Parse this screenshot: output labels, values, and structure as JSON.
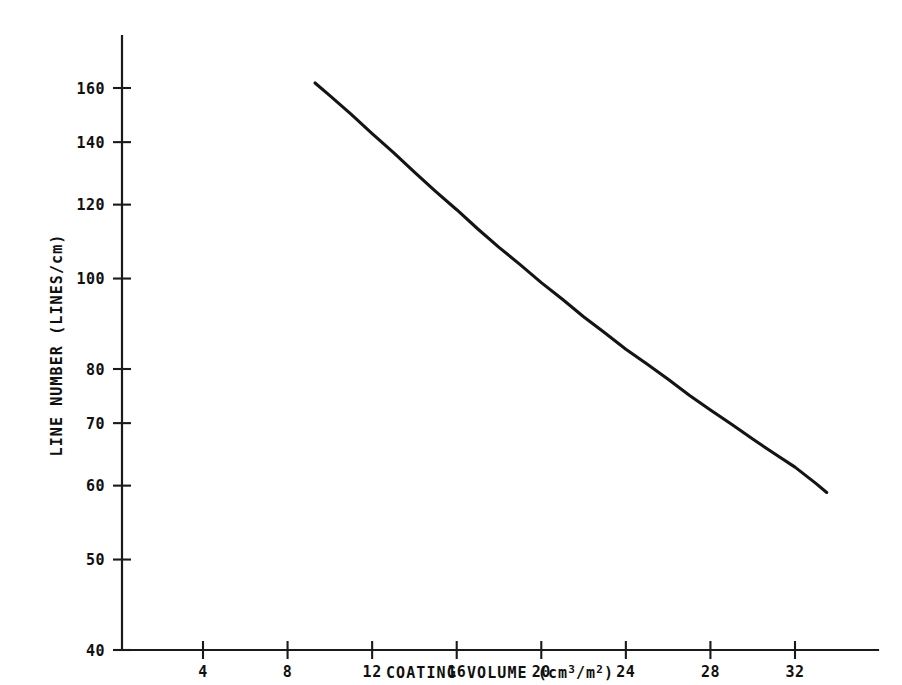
{
  "chart_data": {
    "type": "line",
    "title": "",
    "subtitle": "",
    "xlabel": "COATING VOLUME (cm3/m2)",
    "xlabel_parts": {
      "prefix": "COATING VOLUME (cm",
      "sup1": "3",
      "mid": "/m",
      "sup2": "2",
      "suffix": ")"
    },
    "ylabel": "LINE NUMBER (LINES/cm)",
    "x_scale": "linear",
    "y_scale": "log",
    "xlim": [
      2,
      34.8
    ],
    "ylim": [
      40,
      175
    ],
    "grid": false,
    "legend": null,
    "x_ticks": [
      4,
      8,
      12,
      16,
      20,
      24,
      28,
      32
    ],
    "x_tick_labels": [
      "4",
      "8",
      "12",
      "16",
      "20",
      "24",
      "28",
      "32"
    ],
    "y_ticks": [
      40,
      50,
      60,
      70,
      80,
      100,
      120,
      140,
      160
    ],
    "y_tick_labels": [
      "40",
      "50",
      "60",
      "70",
      "80",
      "100",
      "120",
      "140",
      "160"
    ],
    "series": [
      {
        "name": "line number vs coating volume",
        "x": [
          9.3,
          10.0,
          11.0,
          12.0,
          13.0,
          14.0,
          15.0,
          16.0,
          17.0,
          18.0,
          19.0,
          20.0,
          21.0,
          22.0,
          23.0,
          24.0,
          25.0,
          26.0,
          27.0,
          28.0,
          29.0,
          30.0,
          31.0,
          32.0,
          33.0,
          33.5
        ],
        "y": [
          162.0,
          157.0,
          150.0,
          143.0,
          136.5,
          130.0,
          124.0,
          118.5,
          113.0,
          108.0,
          103.5,
          99.0,
          95.0,
          91.0,
          87.5,
          84.0,
          81.0,
          78.0,
          75.0,
          72.3,
          69.8,
          67.3,
          65.0,
          62.8,
          60.3,
          59.0
        ]
      }
    ]
  }
}
